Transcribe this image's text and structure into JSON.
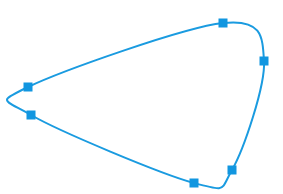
{
  "diagram": {
    "type": "closed-spline",
    "stroke_color": "#1a9be0",
    "handle_color": "#1196e0",
    "stroke_width": 2,
    "handle_size": 9,
    "control_points": [
      {
        "id": "p1",
        "x": 223,
        "y": 23
      },
      {
        "id": "p2",
        "x": 264,
        "y": 61
      },
      {
        "id": "p3",
        "x": 232,
        "y": 170
      },
      {
        "id": "p4",
        "x": 194,
        "y": 183
      },
      {
        "id": "p5",
        "x": 31,
        "y": 115
      },
      {
        "id": "p6",
        "x": 28,
        "y": 87
      }
    ]
  }
}
